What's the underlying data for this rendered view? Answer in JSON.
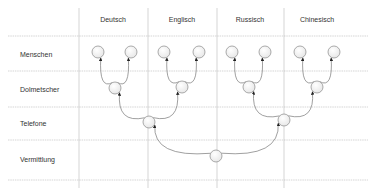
{
  "columns": [
    {
      "label": "Deutsch",
      "x": 113
    },
    {
      "label": "Englisch",
      "x": 182
    },
    {
      "label": "Russisch",
      "x": 250
    },
    {
      "label": "Chinesisch",
      "x": 317
    }
  ],
  "rows": [
    {
      "label": "Menschen",
      "y": 54
    },
    {
      "label": "Dolmetscher",
      "y": 89
    },
    {
      "label": "Telefone",
      "y": 123
    },
    {
      "label": "Vermittlung",
      "y": 159
    }
  ],
  "grid": {
    "horizontal_y": [
      36,
      71,
      107,
      140,
      180
    ],
    "vertical_x": [
      79,
      148,
      217,
      284
    ],
    "x_start": 8,
    "x_end": 368,
    "y_top": 8,
    "y_bottom": 188,
    "color": "#bbbbbb"
  },
  "nodes": [
    {
      "id": "de-1",
      "x": 98,
      "y": 52
    },
    {
      "id": "de-2",
      "x": 131,
      "y": 52
    },
    {
      "id": "en-1",
      "x": 164,
      "y": 52
    },
    {
      "id": "en-2",
      "x": 199,
      "y": 52
    },
    {
      "id": "ru-1",
      "x": 232,
      "y": 52
    },
    {
      "id": "ru-2",
      "x": 265,
      "y": 52
    },
    {
      "id": "zh-1",
      "x": 300,
      "y": 52
    },
    {
      "id": "zh-2",
      "x": 334,
      "y": 52
    },
    {
      "id": "dol-de",
      "x": 115,
      "y": 88
    },
    {
      "id": "dol-en",
      "x": 182,
      "y": 87
    },
    {
      "id": "dol-ru",
      "x": 249,
      "y": 87
    },
    {
      "id": "dol-zh",
      "x": 317,
      "y": 87
    },
    {
      "id": "tel-1",
      "x": 149,
      "y": 122
    },
    {
      "id": "tel-2",
      "x": 284,
      "y": 120
    },
    {
      "id": "verm",
      "x": 216,
      "y": 156
    }
  ],
  "edges": [
    {
      "from": "dol-de",
      "to": "de-1"
    },
    {
      "from": "dol-de",
      "to": "de-2"
    },
    {
      "from": "dol-en",
      "to": "en-1"
    },
    {
      "from": "dol-en",
      "to": "en-2"
    },
    {
      "from": "dol-ru",
      "to": "ru-1"
    },
    {
      "from": "dol-ru",
      "to": "ru-2"
    },
    {
      "from": "dol-zh",
      "to": "zh-1"
    },
    {
      "from": "dol-zh",
      "to": "zh-2"
    },
    {
      "from": "tel-1",
      "to": "dol-de"
    },
    {
      "from": "tel-1",
      "to": "dol-en"
    },
    {
      "from": "tel-2",
      "to": "dol-ru"
    },
    {
      "from": "tel-2",
      "to": "dol-zh"
    },
    {
      "from": "verm",
      "to": "tel-1"
    },
    {
      "from": "verm",
      "to": "tel-2"
    }
  ],
  "style": {
    "node_radius": 6,
    "node_stroke": "#888888",
    "node_fill": "#ffffff",
    "edge_color": "#777777",
    "arrow_color": "#222222"
  }
}
